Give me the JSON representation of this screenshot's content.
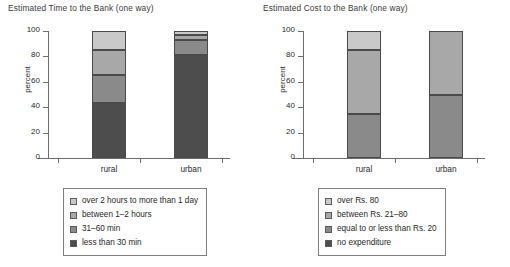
{
  "figure": {
    "width": 510,
    "height": 267
  },
  "palette": {
    "level1_lightest": "#c9c9c9",
    "level2_light": "#a8a8a8",
    "level3_mid": "#8a8a8a",
    "level4_dark": "#4d4d4d",
    "axis": "#6d6d6d",
    "text": "#231f20",
    "segment_border": "#4a4a4a"
  },
  "chart_data": [
    {
      "type": "bar",
      "stacked": true,
      "title": "Estimated Time to the Bank (one way)",
      "xlabel": "",
      "ylabel": "percent",
      "ylim": [
        0,
        100
      ],
      "yticks": [
        0,
        20,
        40,
        60,
        80,
        100
      ],
      "ytick_labels": [
        "0",
        "20",
        "40",
        "60",
        "80",
        "100"
      ],
      "grid": false,
      "legend_position": "below",
      "categories": [
        "rural",
        "urban"
      ],
      "series": [
        {
          "name": "less than 30 min",
          "color": "#4d4d4d",
          "values": [
            43,
            81
          ]
        },
        {
          "name": "31–60 min",
          "color": "#8a8a8a",
          "values": [
            22,
            12
          ]
        },
        {
          "name": "between 1–2 hours",
          "color": "#a8a8a8",
          "values": [
            20,
            4
          ]
        },
        {
          "name": "over 2 hours to more than 1 day",
          "color": "#c9c9c9",
          "values": [
            15,
            3
          ]
        }
      ],
      "legend_entries": [
        {
          "label": "over 2 hours to more than 1 day",
          "color": "#c9c9c9"
        },
        {
          "label": "between 1–2 hours",
          "color": "#a8a8a8"
        },
        {
          "label": "31–60 min",
          "color": "#8a8a8a"
        },
        {
          "label": "less than 30 min",
          "color": "#4d4d4d"
        }
      ]
    },
    {
      "type": "bar",
      "stacked": true,
      "title": "Estimated Cost to the Bank (one way)",
      "xlabel": "",
      "ylabel": "percent",
      "ylim": [
        0,
        100
      ],
      "yticks": [
        0,
        20,
        40,
        60,
        80,
        100
      ],
      "ytick_labels": [
        "0",
        "20",
        "40",
        "60",
        "80",
        "100"
      ],
      "grid": false,
      "legend_position": "below",
      "categories": [
        "rural",
        "urban"
      ],
      "series": [
        {
          "name": "no expenditure",
          "color": "#4d4d4d",
          "values": [
            0,
            0
          ]
        },
        {
          "name": "equal to or less than Rs. 20",
          "color": "#8a8a8a",
          "values": [
            35,
            50
          ]
        },
        {
          "name": "between Rs. 21–80",
          "color": "#a8a8a8",
          "values": [
            50,
            50
          ]
        },
        {
          "name": "over Rs. 80",
          "color": "#c9c9c9",
          "values": [
            15,
            0
          ]
        }
      ],
      "legend_entries": [
        {
          "label": "over Rs. 80",
          "color": "#c9c9c9"
        },
        {
          "label": "between Rs. 21–80",
          "color": "#a8a8a8"
        },
        {
          "label": "equal to or less than Rs. 20",
          "color": "#8a8a8a"
        },
        {
          "label": "no expenditure",
          "color": "#4d4d4d"
        }
      ]
    }
  ]
}
